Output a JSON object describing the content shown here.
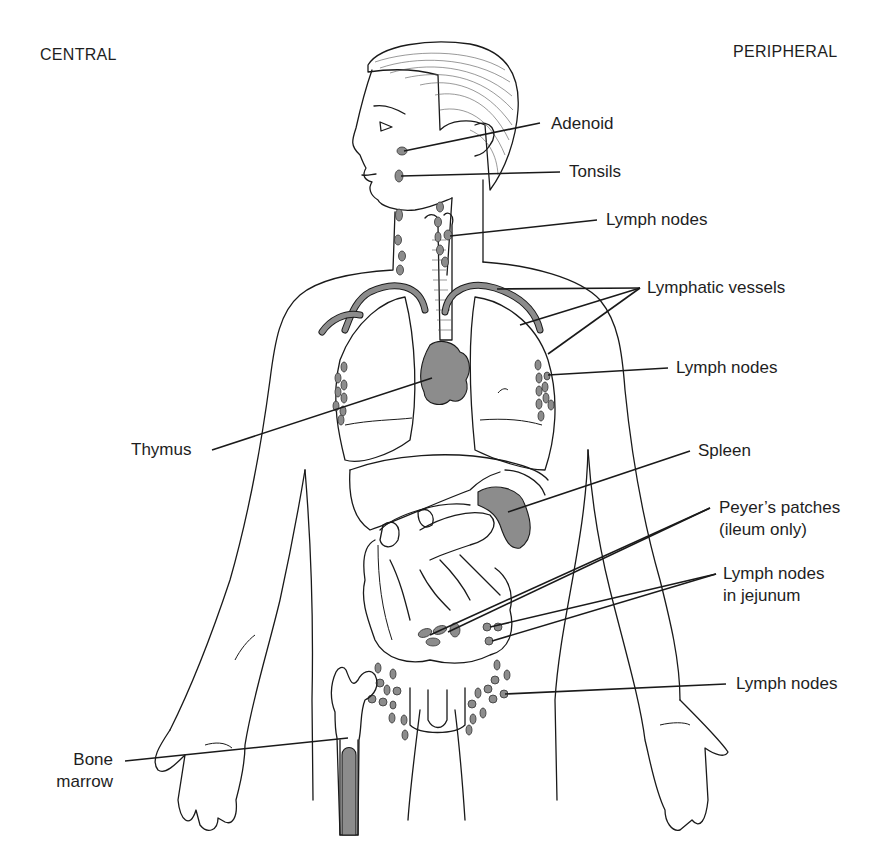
{
  "headings": {
    "central": "CENTRAL",
    "peripheral": "PERIPHERAL"
  },
  "labels": {
    "adenoid": "Adenoid",
    "tonsils": "Tonsils",
    "lymph_nodes_neck": "Lymph nodes",
    "lymphatic_vessels": "Lymphatic vessels",
    "lymph_nodes_axillary": "Lymph nodes",
    "thymus": "Thymus",
    "spleen": "Spleen",
    "peyers_patches_line1": "Peyer’s patches",
    "peyers_patches_line2": "(ileum only)",
    "lymph_nodes_jejunum_line1": "Lymph nodes",
    "lymph_nodes_jejunum_line2": "in jejunum",
    "lymph_nodes_inguinal": "Lymph nodes",
    "bone_marrow_line1": "Bone",
    "bone_marrow_line2": "marrow"
  },
  "colors": {
    "organ_fill": "#8c8c8c",
    "line": "#1a1a1a",
    "background": "#ffffff"
  }
}
